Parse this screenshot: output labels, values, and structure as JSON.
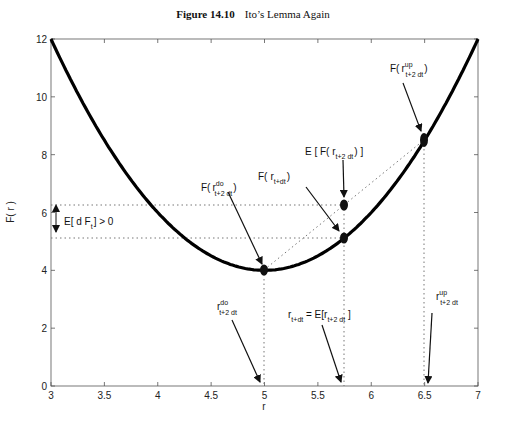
{
  "figure": {
    "number": "Figure 14.10",
    "caption": "Ito’s Lemma Again"
  },
  "chart_data": {
    "type": "line",
    "xlabel": "r",
    "ylabel": "F( r )",
    "xlim": [
      3,
      7
    ],
    "ylim": [
      0,
      12
    ],
    "xticks": [
      "3",
      "3.5",
      "4",
      "4.5",
      "5",
      "5.5",
      "6",
      "6.5",
      "7"
    ],
    "yticks": [
      "0",
      "2",
      "4",
      "6",
      "8",
      "10",
      "12"
    ],
    "grid": false,
    "series": [
      {
        "name": "F(r)",
        "function": "2(r-5)^2 + 4",
        "x": [
          3,
          3.5,
          4,
          4.5,
          5,
          5.5,
          5.75,
          6,
          6.5,
          7
        ],
        "y": [
          12,
          8.5,
          6,
          4.5,
          4,
          4.5,
          5.125,
          6,
          8.5,
          12
        ]
      }
    ],
    "points": [
      {
        "label": "F(r do t+2 dt)",
        "x": 5,
        "y": 4
      },
      {
        "label": "F(r t+dt)",
        "x": 5.75,
        "y": 5.125
      },
      {
        "label": "E[F(r t+2 dt)]",
        "x": 5.75,
        "y": 6.25
      },
      {
        "label": "F(r up t+2 dt)",
        "x": 6.5,
        "y": 8.5
      }
    ],
    "annotations": [
      {
        "text": "F( r^do_t+2 dt )"
      },
      {
        "text": "F( r_t+dt )"
      },
      {
        "text": "E [ F( r_t+2 dt ) ]"
      },
      {
        "text": "F( r^up_t+2 dt )"
      },
      {
        "text": "E[ d F_t ] > 0"
      },
      {
        "text": "r^do_t+2 dt"
      },
      {
        "text": "r_t+dt = E[r_t+2 dt ]"
      },
      {
        "text": "r^up_t+2 dt"
      }
    ]
  },
  "labels": {
    "F": "F(",
    "close": ")",
    "r": "r",
    "do": "do",
    "up": "up",
    "t2dt": "t+2 dt",
    "tdt": "t+dt",
    "t": "t",
    "E_open": "E [ F( r",
    "E_close": ") ]",
    "edf_a": "E[ d F",
    "edf_b": "] > 0",
    "req_a": "r",
    "req_b": " = E[r",
    "req_c": " ]"
  }
}
